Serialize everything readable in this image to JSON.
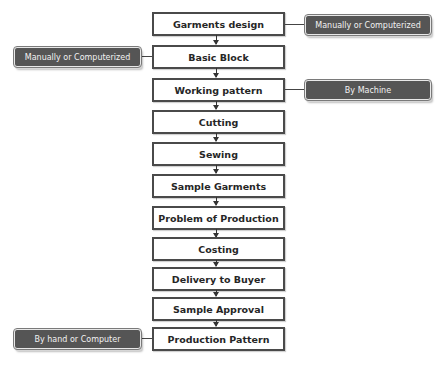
{
  "diagram": {
    "type": "vertical-flowchart",
    "steps": [
      {
        "label": "Garments design"
      },
      {
        "label": "Basic Block"
      },
      {
        "label": "Working pattern"
      },
      {
        "label": "Cutting"
      },
      {
        "label": "Sewing"
      },
      {
        "label": "Sample Garments"
      },
      {
        "label": "Problem of Production"
      },
      {
        "label": "Costing"
      },
      {
        "label": "Delivery to Buyer"
      },
      {
        "label": "Sample Approval"
      },
      {
        "label": "Production Pattern"
      }
    ],
    "notes": [
      {
        "label": "Manually or Computerized",
        "attached_to": "Garments design",
        "side": "right"
      },
      {
        "label": "Manually or Computerized",
        "attached_to": "Basic Block",
        "side": "left"
      },
      {
        "label": "By Machine",
        "attached_to": "Working pattern",
        "side": "right"
      },
      {
        "label": "By hand or Computer",
        "attached_to": "Production Pattern",
        "side": "left"
      }
    ],
    "colors": {
      "step_border": "#4a4a4a",
      "step_fill": "#ffffff",
      "note_fill": "#555555",
      "note_text": "#f2f2f2"
    }
  }
}
